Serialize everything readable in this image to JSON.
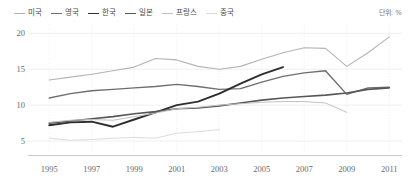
{
  "unit_note": "단위: %",
  "legend": {
    "position": "top-left",
    "items": [
      {
        "label": "미국",
        "color": "#b4b4b4",
        "width": 1.1
      },
      {
        "label": "영국",
        "color": "#6e6e6e",
        "width": 1.4
      },
      {
        "label": "한국",
        "color": "#2e2e2e",
        "width": 1.9
      },
      {
        "label": "일본",
        "color": "#575757",
        "width": 1.6
      },
      {
        "label": "프랑스",
        "color": "#c2c2c2",
        "width": 1.0
      },
      {
        "label": "중국",
        "color": "#dcdcdc",
        "width": 1.0
      }
    ]
  },
  "chart_data": {
    "type": "line",
    "title": "",
    "xlabel": "",
    "ylabel": "",
    "unit": "%",
    "grid": true,
    "legend_position": "top-left",
    "xlim": [
      1994,
      2011.6
    ],
    "ylim": [
      3.2,
      21.3
    ],
    "yticks": [
      5,
      10,
      15,
      20
    ],
    "xticks": [
      1995,
      1997,
      1999,
      2001,
      2003,
      2005,
      2007,
      2009,
      2011
    ],
    "xtick_labels": [
      "1995",
      "1997",
      "1999",
      "2001",
      "2003",
      "2005",
      "2007",
      "2009",
      "2011"
    ],
    "ytick_labels": [
      "5",
      "10",
      "15",
      "20"
    ],
    "series": [
      {
        "name": "미국",
        "color": "#b4b4b4",
        "x": [
          1995,
          1996,
          1997,
          1998,
          1999,
          2000,
          2001,
          2002,
          2003,
          2004,
          2005,
          2006,
          2007,
          2008,
          2009,
          2010,
          2011
        ],
        "values": [
          13.5,
          13.9,
          14.3,
          14.8,
          15.3,
          16.5,
          16.3,
          15.4,
          15.0,
          15.4,
          16.4,
          17.3,
          18.0,
          17.9,
          15.4,
          17.3,
          19.5
        ]
      },
      {
        "name": "영국",
        "color": "#6e6e6e",
        "x": [
          1995,
          1996,
          1997,
          1998,
          1999,
          2000,
          2001,
          2002,
          2003,
          2004,
          2005,
          2006,
          2007,
          2008,
          2009,
          2010,
          2011
        ],
        "values": [
          11.0,
          11.6,
          12.0,
          12.2,
          12.4,
          12.6,
          12.9,
          12.6,
          12.2,
          12.3,
          13.2,
          14.0,
          14.5,
          14.8,
          11.5,
          12.4,
          12.5
        ]
      },
      {
        "name": "한국",
        "color": "#2e2e2e",
        "x": [
          1995,
          1996,
          1997,
          1998,
          1999,
          2000,
          2001,
          2002,
          2003,
          2004,
          2005,
          2006
        ],
        "values": [
          7.2,
          7.6,
          7.7,
          7.0,
          8.0,
          9.0,
          10.0,
          10.5,
          11.6,
          13.0,
          14.3,
          15.3
        ]
      },
      {
        "name": "일본",
        "color": "#575757",
        "x": [
          1995,
          1996,
          1997,
          1998,
          1999,
          2000,
          2001,
          2002,
          2003,
          2004,
          2005,
          2006,
          2007,
          2008,
          2009,
          2010,
          2011
        ],
        "values": [
          7.5,
          7.8,
          8.1,
          8.4,
          8.8,
          9.1,
          9.5,
          9.6,
          9.9,
          10.3,
          10.7,
          11.0,
          11.2,
          11.4,
          11.7,
          12.2,
          12.4
        ]
      },
      {
        "name": "프랑스",
        "color": "#c2c2c2",
        "x": [
          1995,
          1996,
          1997,
          1998,
          1999,
          2000,
          2001,
          2002,
          2003,
          2004,
          2005,
          2006,
          2007,
          2008,
          2009
        ],
        "values": [
          7.6,
          7.9,
          8.0,
          7.9,
          8.4,
          8.9,
          9.5,
          9.7,
          10.0,
          10.2,
          10.4,
          10.5,
          10.5,
          10.3,
          9.0
        ]
      },
      {
        "name": "중국",
        "color": "#dcdcdc",
        "x": [
          1995,
          1996,
          1997,
          1998,
          1999,
          2000,
          2001,
          2002,
          2003
        ],
        "values": [
          5.4,
          5.1,
          5.2,
          5.4,
          5.5,
          5.4,
          6.1,
          6.3,
          6.6
        ]
      }
    ]
  }
}
